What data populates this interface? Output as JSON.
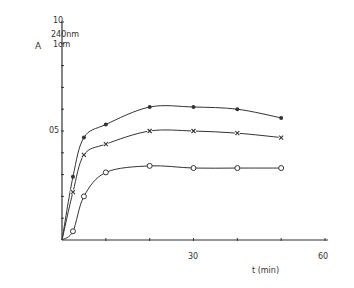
{
  "chart_data": {
    "type": "line",
    "title": "",
    "xlabel": "t (min)",
    "ylabel_main": "A",
    "ylabel_sup": "240nm",
    "ylabel_sub": "1cm",
    "xlim": [
      0,
      60
    ],
    "ylim": [
      0,
      1.0
    ],
    "x_ticks": [
      0,
      10,
      20,
      30,
      40,
      50,
      60
    ],
    "x_tick_labels": [
      "30",
      "60"
    ],
    "y_ticks": [
      0,
      0.1,
      0.2,
      0.3,
      0.4,
      0.5,
      0.6,
      0.7,
      0.8,
      0.9,
      1.0
    ],
    "y_tick_labels": [
      "05",
      "10"
    ],
    "grid": false,
    "legend": null,
    "x": [
      2.5,
      5,
      10,
      20,
      30,
      40,
      50
    ],
    "series": [
      {
        "name": "filled-circle series",
        "marker": "filled-circle",
        "values": [
          0.29,
          0.47,
          0.53,
          0.61,
          0.61,
          0.6,
          0.56
        ]
      },
      {
        "name": "cross series",
        "marker": "cross",
        "values": [
          0.22,
          0.39,
          0.44,
          0.5,
          0.5,
          0.49,
          0.47
        ]
      },
      {
        "name": "open-circle series",
        "marker": "open-circle",
        "values": [
          0.04,
          0.2,
          0.31,
          0.34,
          0.33,
          0.33,
          0.33
        ]
      }
    ]
  },
  "labels": {
    "ylabel_main": "A",
    "ylabel_sup": "240nm",
    "ylabel_sub": "1cm",
    "ytick_top": "10",
    "ytick_mid": "05",
    "xtick_30": "30",
    "xtick_60": "60",
    "xlabel": "t (min)"
  }
}
